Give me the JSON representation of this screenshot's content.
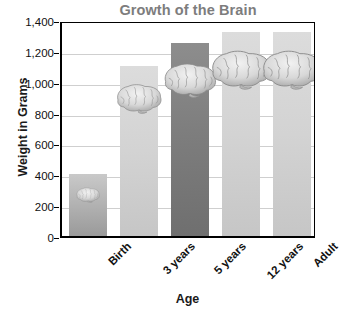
{
  "chart_data": {
    "type": "bar",
    "title": "Growth of the Brain",
    "xlabel": "Age",
    "ylabel": "Weight in Grams",
    "categories": [
      "Birth",
      "3 years",
      "5 years",
      "12 years",
      "Adult"
    ],
    "values": [
      400,
      1100,
      1250,
      1320,
      1320
    ],
    "ylim": [
      0,
      1400
    ],
    "ytick_labels": [
      "0",
      "200",
      "400",
      "600",
      "800",
      "1,000",
      "1,200",
      "1,400"
    ],
    "ytick_values": [
      0,
      200,
      400,
      600,
      800,
      1000,
      1200,
      1400
    ],
    "grid": true,
    "legend": false,
    "bar_styles": [
      "medium",
      "light",
      "dark",
      "light",
      "light"
    ],
    "annotations": [
      "brain illustration on each bar, scaled with bar value"
    ]
  },
  "colors": {
    "title": "#7d7d7d",
    "axis": "#000000",
    "gridline": "#cfcfcf",
    "text": "#111111",
    "bar_medium": "#b4b4b4",
    "bar_light": "#d3d3d3",
    "bar_dark": "#7e7e7e",
    "background": "#ffffff"
  },
  "icons": {
    "brain": "brain-icon"
  }
}
